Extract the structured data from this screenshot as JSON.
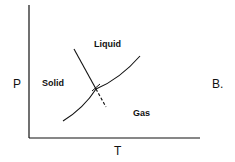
{
  "diagram": {
    "type": "phase-diagram",
    "panel_label": "B.",
    "axes": {
      "x_label": "T",
      "y_label": "P"
    },
    "regions": [
      {
        "name": "solid",
        "label": "Solid"
      },
      {
        "name": "liquid",
        "label": "Liquid"
      },
      {
        "name": "gas",
        "label": "Gas"
      }
    ],
    "curves": [
      {
        "name": "fusion-line",
        "style": "solid",
        "slope": "negative"
      },
      {
        "name": "fusion-line-extension",
        "style": "dashed"
      },
      {
        "name": "sublimation-vaporization-curve",
        "style": "solid"
      }
    ],
    "colors": {
      "ink": "#111111",
      "background": "#ffffff"
    }
  }
}
